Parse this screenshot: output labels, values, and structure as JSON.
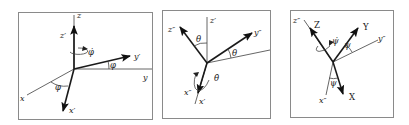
{
  "diagram": {
    "type": "euler-angle-rotation-sequence",
    "panels": [
      {
        "id": "rotation-1",
        "rotation_angle": "φ",
        "rate_label": "φ̇",
        "rotation_axis": "z",
        "fixed_axes": [
          "x",
          "y",
          "z"
        ],
        "rotated_axes": [
          "x′",
          "y′",
          "z′"
        ],
        "labels": {
          "z": "z",
          "zp": "z′",
          "y": "y",
          "yp": "y′",
          "x": "x",
          "xp": "x′",
          "rate": "φ̇",
          "angle1": "φ",
          "angle2": "φ"
        }
      },
      {
        "id": "rotation-2",
        "rotation_angle": "θ",
        "rate_label": "θ̇",
        "rotation_axis": "x′",
        "fixed_axes": [
          "x′",
          "y′",
          "z′"
        ],
        "rotated_axes": [
          "x″",
          "y″",
          "z″"
        ],
        "labels": {
          "zp": "z′",
          "zpp": "z″",
          "yp": "y′",
          "ypp": "y″",
          "xp": "x′",
          "xpp": "x″",
          "rate": "θ̇",
          "angle1": "θ",
          "angle2": "θ"
        }
      },
      {
        "id": "rotation-3",
        "rotation_angle": "ψ",
        "rate_label": "ψ̇",
        "rotation_axis": "z″",
        "fixed_axes": [
          "x″",
          "y″",
          "z″"
        ],
        "rotated_axes": [
          "X",
          "Y",
          "Z"
        ],
        "labels": {
          "zpp": "z″",
          "Z": "Z",
          "ypp": "y″",
          "Y": "Y",
          "xpp": "x″",
          "X": "X",
          "rate": "ψ̇",
          "angle1": "ψ",
          "angle2": "ψ"
        }
      }
    ]
  }
}
